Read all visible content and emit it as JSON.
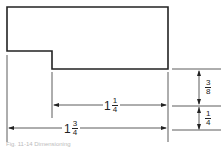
{
  "drawing": {
    "stroke_color": "#222222",
    "dimensions": {
      "horizontal_inner": {
        "whole": "1",
        "num": "1",
        "den": "4"
      },
      "horizontal_overall": {
        "whole": "1",
        "num": "3",
        "den": "4"
      },
      "vertical_upper": {
        "whole": "",
        "num": "3",
        "den": "8"
      },
      "vertical_lower": {
        "whole": "",
        "num": "1",
        "den": "4"
      }
    }
  },
  "caption": {
    "text": "Fig. 11-14  Dimensioning"
  }
}
